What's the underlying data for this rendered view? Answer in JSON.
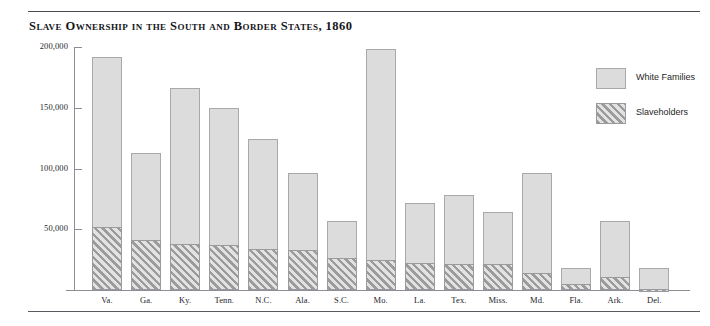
{
  "figure": {
    "title": "Slave Ownership in the South and Border States, 1860"
  },
  "legend": {
    "items": [
      {
        "label": "White Families",
        "swatch": "solid-gray",
        "color": "#dcdcdc"
      },
      {
        "label": "Slaveholders",
        "swatch": "diagonal-hatch",
        "color": "#9b9b9b"
      }
    ]
  },
  "axes": {
    "y_ticks": [
      "50,000",
      "100,000",
      "150,000",
      "200,000"
    ],
    "y_tick_values": [
      50000,
      100000,
      150000,
      200000
    ]
  },
  "chart_data": {
    "type": "bar",
    "title": "Slave Ownership in the South and Border States, 1860",
    "subtitle": "",
    "xlabel": "",
    "ylabel": "",
    "stacked": true,
    "grid": false,
    "legend_position": "upper-right",
    "ylim": [
      0,
      210000
    ],
    "yticks": [
      50000,
      100000,
      150000,
      200000
    ],
    "ytick_labels": [
      "50,000",
      "100,000",
      "150,000",
      "200,000"
    ],
    "categories": [
      "Va.",
      "Ga.",
      "Ky.",
      "Tenn.",
      "N.C.",
      "Ala.",
      "S.C.",
      "Mo.",
      "La.",
      "Tex.",
      "Miss.",
      "Md.",
      "Fla.",
      "Ark.",
      "Del."
    ],
    "series": [
      {
        "name": "Slaveholders",
        "values": [
          52000,
          41000,
          38000,
          37000,
          34000,
          33000,
          26000,
          25000,
          22000,
          21000,
          21000,
          14000,
          5000,
          11000,
          600
        ]
      },
      {
        "name": "White Families",
        "values": [
          192000,
          113000,
          166000,
          150000,
          124000,
          96000,
          57000,
          198000,
          72000,
          78000,
          64000,
          96000,
          18000,
          57000,
          18000
        ]
      }
    ],
    "note": "White Families values are cumulative bar totals; Slaveholders is the hatched lower portion of each stacked bar."
  }
}
